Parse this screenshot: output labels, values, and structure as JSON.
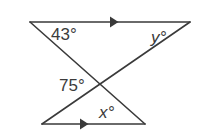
{
  "figure": {
    "item_number": ".",
    "background_color": "#ffffff",
    "stroke_color": "#3a3a3a",
    "labels": {
      "top_left_angle": "43°",
      "top_right_angle": "y°",
      "intersection_angle": "75°",
      "bottom_angle": "x°"
    },
    "geometry": {
      "top_line": {
        "x1": 30,
        "y1": 22,
        "x2": 190,
        "y2": 22
      },
      "bottom_line": {
        "x1": 42,
        "y1": 124,
        "x2": 145,
        "y2": 124
      },
      "transversal_left": {
        "x1": 30,
        "y1": 22,
        "x2": 145,
        "y2": 124
      },
      "transversal_right": {
        "x1": 190,
        "y1": 22,
        "x2": 42,
        "y2": 124
      },
      "intersection_point": {
        "x": 94,
        "y": 88
      },
      "top_arrow_marker": {
        "x": 115,
        "y": 22
      },
      "bottom_arrow_marker": {
        "x": 85,
        "y": 124
      }
    }
  }
}
